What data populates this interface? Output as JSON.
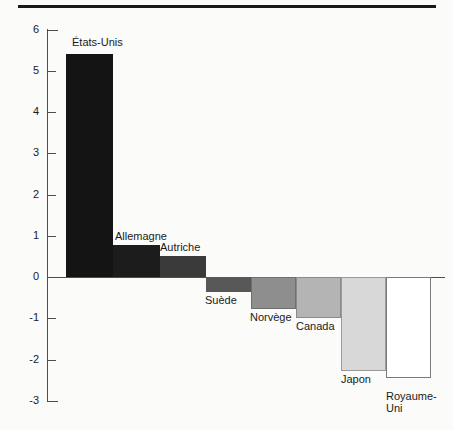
{
  "figure": {
    "top_rule": true,
    "background_color": "#fbfbfa",
    "axis_color": "#4d4d4d",
    "text_color": "#1a1a1a"
  },
  "chart_data": {
    "type": "bar",
    "title": "",
    "subtitle": "",
    "xlabel": "",
    "ylabel": "",
    "ylim": [
      -3,
      6
    ],
    "yticks": [
      6,
      5,
      4,
      3,
      2,
      1,
      0,
      -1,
      -2,
      -3
    ],
    "ytick_labels": [
      "6",
      "5",
      "4",
      "3",
      "2",
      "1",
      "0",
      "-1",
      "-2",
      "-3"
    ],
    "grid": false,
    "legend": "none",
    "orientation": "vertical",
    "baseline": 0,
    "categories": [
      "États-Unis",
      "Allemagne",
      "Autriche",
      "Suède",
      "Norvège",
      "Canada",
      "Japon",
      "Royaume-Uni"
    ],
    "values": [
      5.4,
      0.78,
      0.5,
      -0.37,
      -0.78,
      -1.0,
      -2.28,
      -2.45
    ],
    "bar_colors": [
      "#141414",
      "#1c1c1c",
      "#3a3a3a",
      "#585858",
      "#8e8e8e",
      "#b4b4b4",
      "#d8d8d8",
      "#ffffff"
    ],
    "bar_edge_colors": [
      "#141414",
      "#1c1c1c",
      "#3a3a3a",
      "#585858",
      "#6f6f6f",
      "#8a8a8a",
      "#9a9a9a",
      "#7a7a7a"
    ],
    "bars": [
      {
        "label": "États-Unis",
        "value": 5.4,
        "color": "#141414",
        "edge": "#141414",
        "x": 66,
        "width": 47,
        "label_x": 72,
        "label_y": 36,
        "label_wrap": false
      },
      {
        "label": "Allemagne",
        "value": 0.78,
        "color": "#1c1c1c",
        "edge": "#1c1c1c",
        "x": 113,
        "width": 47,
        "label_x": 115,
        "label_y": 230,
        "label_wrap": false
      },
      {
        "label": "Autriche",
        "value": 0.5,
        "color": "#3a3a3a",
        "edge": "#3a3a3a",
        "x": 160,
        "width": 46,
        "label_x": 160,
        "label_y": 241,
        "label_wrap": false
      },
      {
        "label": "Suède",
        "value": -0.37,
        "color": "#585858",
        "edge": "#585858",
        "x": 206,
        "width": 45,
        "label_x": 205,
        "label_y": 294,
        "label_wrap": false
      },
      {
        "label": "Norvège",
        "value": -0.78,
        "color": "#8e8e8e",
        "edge": "#6f6f6f",
        "x": 251,
        "width": 45,
        "label_x": 250,
        "label_y": 311,
        "label_wrap": false
      },
      {
        "label": "Canada",
        "value": -1.0,
        "color": "#b4b4b4",
        "edge": "#8a8a8a",
        "x": 296,
        "width": 45,
        "label_x": 296,
        "label_y": 320,
        "label_wrap": false
      },
      {
        "label": "Japon",
        "value": -2.28,
        "color": "#d8d8d8",
        "edge": "#9a9a9a",
        "x": 341,
        "width": 45,
        "label_x": 341,
        "label_y": 373,
        "label_wrap": false
      },
      {
        "label": "Royaume-Uni",
        "value": -2.45,
        "color": "#ffffff",
        "edge": "#7a7a7a",
        "x": 386,
        "width": 45,
        "label_x": 386,
        "label_y": 390,
        "label_wrap": true
      }
    ]
  }
}
